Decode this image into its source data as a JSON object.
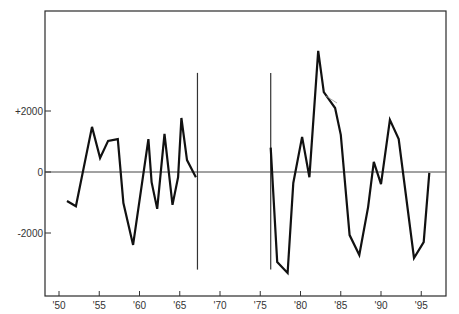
{
  "chart_data": {
    "type": "line",
    "title": "",
    "xlabel": "",
    "ylabel": "",
    "xlim": [
      48.2,
      98.0
    ],
    "ylim": [
      -4000,
      5200
    ],
    "grid": false,
    "legend": null,
    "x_ticks": [
      50,
      55,
      60,
      65,
      70,
      75,
      80,
      85,
      90,
      95
    ],
    "x_tick_labels": [
      "'50",
      "'55",
      "'60",
      "'65",
      "'70",
      "'75",
      "'80",
      "'85",
      "'90",
      "'95"
    ],
    "y_ticks": [
      2000,
      0,
      -2000
    ],
    "y_tick_labels": [
      "+2000",
      "0",
      "-2000"
    ],
    "reference_lines": {
      "horizontal_zero": 0,
      "vertical_markers": [
        {
          "x": 67.2,
          "y_from": -3200,
          "y_to": 3250
        },
        {
          "x": 76.3,
          "y_from": -3200,
          "y_to": 3250
        }
      ]
    },
    "series": [
      {
        "name": "period-1",
        "x": [
          51.0,
          52.1,
          54.1,
          55.1,
          56.1,
          57.3,
          58.0,
          59.2,
          61.1,
          61.5,
          62.2,
          63.1,
          64.1,
          64.8,
          65.2,
          65.9,
          67.0
        ],
        "values": [
          -950,
          -1120,
          1480,
          460,
          1020,
          1080,
          -1020,
          -2390,
          1080,
          -330,
          -1210,
          1250,
          -1080,
          -170,
          1770,
          390,
          -170
        ]
      },
      {
        "name": "period-2",
        "x": [
          76.3,
          77.1,
          78.4,
          79.1,
          80.2,
          81.1,
          82.2,
          82.9,
          84.3,
          85.0,
          86.1,
          87.3,
          88.4,
          89.1,
          90.0,
          91.1,
          92.2,
          94.1,
          95.3,
          96.0
        ],
        "values": [
          800,
          -2950,
          -3310,
          -360,
          1150,
          -170,
          3970,
          2620,
          2100,
          1220,
          -2070,
          -2720,
          -1150,
          330,
          -400,
          1710,
          1080,
          -2820,
          -2300,
          -30
        ]
      }
    ]
  },
  "colors": {
    "line": "#111111",
    "axis": "#2a2a2a",
    "background": "#ffffff"
  }
}
